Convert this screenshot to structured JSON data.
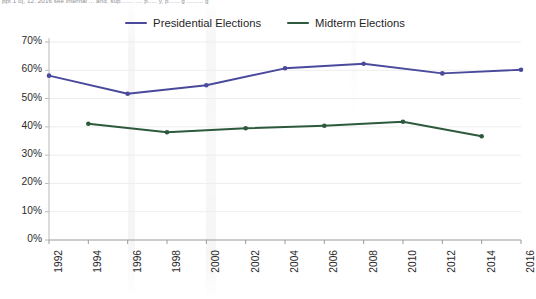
{
  "top_caption": "ppt 1 o], 12. 2016 see internal   ... and, sup....... .... p..... y, p...... g ......... g",
  "legend": {
    "position": "top-center",
    "items": [
      {
        "label": "Presidential Elections",
        "color": "#4a4a9c",
        "name": "presidential"
      },
      {
        "label": "Midterm Elections",
        "color": "#2d5a3d",
        "name": "midterm"
      }
    ]
  },
  "axes": {
    "y_ticks": [
      "0%",
      "10%",
      "20%",
      "30%",
      "40%",
      "50%",
      "60%",
      "70%"
    ],
    "x_ticks": [
      "1992",
      "1994",
      "1996",
      "1998",
      "2000",
      "2002",
      "2004",
      "2006",
      "2008",
      "2010",
      "2012",
      "2014",
      "2016"
    ]
  },
  "chart_data": {
    "type": "line",
    "title": "",
    "xlabel": "",
    "ylabel": "",
    "x": [
      1992,
      1994,
      1996,
      1998,
      2000,
      2002,
      2004,
      2006,
      2008,
      2010,
      2012,
      2014,
      2016
    ],
    "ylim": [
      0,
      70
    ],
    "ytick_values": [
      0,
      10,
      20,
      30,
      40,
      50,
      60,
      70
    ],
    "yunit": "%",
    "grid": true,
    "legend_position": "top-center",
    "series": [
      {
        "name": "Presidential Elections",
        "color": "#4a4a9c",
        "points": [
          {
            "x": 1992,
            "y": 58.1
          },
          {
            "x": 1996,
            "y": 51.7
          },
          {
            "x": 2000,
            "y": 54.7
          },
          {
            "x": 2004,
            "y": 60.7
          },
          {
            "x": 2008,
            "y": 62.3
          },
          {
            "x": 2012,
            "y": 58.9
          },
          {
            "x": 2016,
            "y": 60.2
          }
        ]
      },
      {
        "name": "Midterm Elections",
        "color": "#2d5a3d",
        "points": [
          {
            "x": 1994,
            "y": 41.1
          },
          {
            "x": 1998,
            "y": 38.1
          },
          {
            "x": 2002,
            "y": 39.5
          },
          {
            "x": 2006,
            "y": 40.4
          },
          {
            "x": 2010,
            "y": 41.8
          },
          {
            "x": 2014,
            "y": 36.7
          }
        ]
      }
    ]
  }
}
